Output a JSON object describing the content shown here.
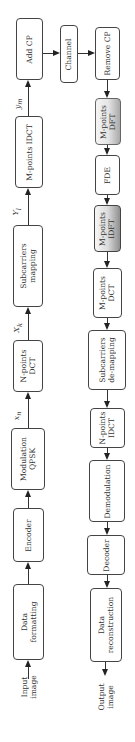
{
  "diagram": {
    "orientation": "rotated -90deg (text reads bottom-to-top)",
    "transmitter": {
      "input": [
        "Input",
        "image"
      ],
      "blocks": [
        {
          "id": "data-formatting",
          "lines": [
            "Data",
            "formatting"
          ]
        },
        {
          "id": "encoder",
          "lines": [
            "Encoder"
          ]
        },
        {
          "id": "modulation",
          "lines": [
            "Modulation",
            "QPSK"
          ]
        },
        {
          "id": "n-points-dct",
          "lines": [
            "N-points",
            "DCT"
          ]
        },
        {
          "id": "subcarriers-mapping",
          "lines": [
            "Subcarriers",
            "mapping"
          ]
        },
        {
          "id": "m-points-idct",
          "lines": [
            "M-points IDCT"
          ]
        },
        {
          "id": "add-cp",
          "lines": [
            "Add CP"
          ]
        }
      ],
      "signals": {
        "after_modulation": "x_n",
        "after_dct": "X_k",
        "after_mapping": "Y_l",
        "after_idct": "y_m"
      }
    },
    "channel": {
      "label": "Channel"
    },
    "receiver": {
      "blocks": [
        {
          "id": "remove-cp",
          "lines": [
            "Remove CP"
          ]
        },
        {
          "id": "m-points-dft",
          "lines": [
            "M-points",
            "DFT"
          ]
        },
        {
          "id": "fde",
          "lines": [
            "FDE"
          ]
        },
        {
          "id": "m-points-idft",
          "lines": [
            "M-points",
            "IDFT"
          ]
        },
        {
          "id": "m-points-dct",
          "lines": [
            "M-points",
            "DCT"
          ]
        },
        {
          "id": "subcarriers-demapping",
          "lines": [
            "Subcarriers",
            "de-mapping"
          ]
        },
        {
          "id": "n-points-idct",
          "lines": [
            "N-points",
            "IDCT"
          ]
        },
        {
          "id": "demodulation",
          "lines": [
            "Demodulation"
          ]
        },
        {
          "id": "decoder",
          "lines": [
            "Decoder"
          ]
        },
        {
          "id": "data-reconstruction",
          "lines": [
            "Data",
            "reconstruction"
          ]
        }
      ],
      "output": [
        "Output",
        "image"
      ]
    },
    "signal_labels": {
      "xn": {
        "base": "x",
        "sub": "n"
      },
      "Xk": {
        "base": "X",
        "sub": "k"
      },
      "Yl": {
        "base": "Y",
        "sub": "l"
      },
      "ym": {
        "base": "y",
        "sub": "m"
      }
    }
  }
}
